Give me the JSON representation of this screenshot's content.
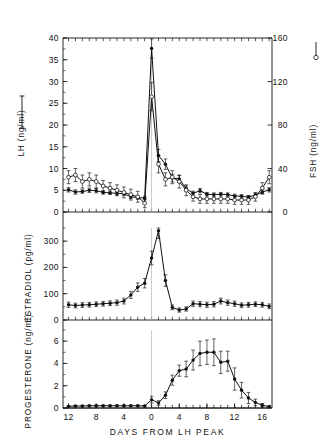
{
  "figure": {
    "xlabel": "DAYS FROM LH PEAK",
    "x_ticks": [
      "12",
      "8",
      "4",
      "0",
      "4",
      "8",
      "12",
      "16"
    ],
    "x_tick_values": [
      -12,
      -8,
      -4,
      0,
      4,
      8,
      12,
      16
    ],
    "x_range": [
      -12.8,
      17.4
    ],
    "reference_line_label": "0",
    "ink_color": "#111111"
  },
  "panels": {
    "top": {
      "left_axis_label": "LH (ng/ml)",
      "left_ticks": [
        "0",
        "5",
        "10",
        "15",
        "20",
        "25",
        "30",
        "35",
        "40"
      ],
      "right_axis_label": "FSH (ng/ml)",
      "right_ticks": [
        "0",
        "40",
        "80",
        "120",
        "160"
      ],
      "left_marker": "filled-circle",
      "right_marker": "open-circle"
    },
    "middle": {
      "left_axis_label": "ESTRADIOL (pg/ml)",
      "left_ticks": [
        "0",
        "100",
        "200",
        "300"
      ],
      "marker": "filled-circle"
    },
    "bottom": {
      "left_axis_label": "PROGESTERONE (ng/ml)",
      "left_ticks": [
        "0",
        "2",
        "4",
        "6"
      ],
      "marker": "filled-circle"
    }
  },
  "chart_data": {
    "type": "line",
    "title": "",
    "xlabel": "DAYS FROM LH PEAK",
    "subplots": [
      {
        "name": "LH and FSH",
        "ylabel": "LH (ng/ml)",
        "ylim": [
          0,
          40
        ],
        "y2label": "FSH (ng/ml)",
        "y2lim": [
          0,
          160
        ],
        "yticks": [
          0,
          5,
          10,
          15,
          20,
          25,
          30,
          35,
          40
        ],
        "y2ticks": [
          0,
          40,
          80,
          120,
          160
        ],
        "grid": false,
        "series": [
          {
            "name": "LH",
            "axis": "left",
            "marker": "filled-circle",
            "x": [
              -12,
              -11,
              -10,
              -9,
              -8,
              -7,
              -6,
              -5,
              -4,
              -3,
              -2,
              -1,
              0,
              1,
              2,
              3,
              4,
              5,
              6,
              7,
              8,
              9,
              10,
              11,
              12,
              13,
              14,
              15,
              16,
              17
            ],
            "values": [
              5.1,
              4.6,
              4.7,
              5.0,
              4.9,
              4.5,
              4.4,
              4.3,
              4.2,
              3.5,
              3.3,
              3.2,
              37.6,
              13.0,
              11.0,
              7.8,
              7.6,
              5.4,
              4.3,
              4.9,
              4.1,
              4.0,
              4.1,
              4.0,
              3.7,
              3.6,
              3.4,
              3.9,
              4.6,
              5.1
            ],
            "errors": [
              0.5,
              0.5,
              0.4,
              0.5,
              0.5,
              0.4,
              0.4,
              0.4,
              0.4,
              0.4,
              0.4,
              0.4,
              2.2,
              1.4,
              1.2,
              0.9,
              0.8,
              0.6,
              0.5,
              0.5,
              0.4,
              0.4,
              0.4,
              0.4,
              0.4,
              0.4,
              0.4,
              0.4,
              0.5,
              0.5
            ]
          },
          {
            "name": "FSH",
            "axis": "right",
            "marker": "open-circle",
            "x": [
              -12,
              -11,
              -10,
              -9,
              -8,
              -7,
              -6,
              -5,
              -4,
              -3,
              -2,
              -1,
              0,
              1,
              2,
              3,
              4,
              5,
              6,
              7,
              8,
              9,
              10,
              11,
              12,
              13,
              14,
              15,
              16,
              17
            ],
            "values": [
              32,
              34,
              28,
              30,
              28,
              24,
              22,
              20,
              18,
              16,
              14,
              8,
              106,
              44,
              30,
              32,
              28,
              20,
              14,
              12,
              12,
              12,
              12,
              12,
              11,
              11,
              11,
              14,
              22,
              32
            ],
            "errors": [
              6,
              6,
              6,
              6,
              6,
              5,
              5,
              5,
              5,
              5,
              5,
              4,
              13,
              8,
              6,
              6,
              6,
              5,
              4,
              4,
              4,
              4,
              4,
              4,
              4,
              4,
              4,
              4,
              5,
              6
            ]
          }
        ]
      },
      {
        "name": "Estradiol",
        "ylabel": "ESTRADIOL (pg/ml)",
        "ylim": [
          0,
          350
        ],
        "yticks": [
          0,
          100,
          200,
          300
        ],
        "grid": false,
        "series": [
          {
            "name": "Estradiol",
            "marker": "filled-circle",
            "x": [
              -12,
              -11,
              -10,
              -9,
              -8,
              -7,
              -6,
              -5,
              -4,
              -3,
              -2,
              -1,
              0,
              1,
              2,
              3,
              4,
              5,
              6,
              7,
              8,
              9,
              10,
              11,
              12,
              13,
              14,
              15,
              16,
              17
            ],
            "values": [
              58,
              55,
              57,
              58,
              60,
              62,
              64,
              66,
              72,
              95,
              125,
              140,
              236,
              340,
              150,
              48,
              38,
              42,
              62,
              60,
              58,
              60,
              72,
              66,
              62,
              56,
              58,
              60,
              58,
              52
            ],
            "errors": [
              10,
              9,
              9,
              9,
              9,
              9,
              9,
              10,
              11,
              13,
              16,
              18,
              26,
              30,
              22,
              9,
              8,
              8,
              10,
              10,
              10,
              10,
              11,
              10,
              10,
              9,
              9,
              9,
              9,
              9
            ]
          }
        ]
      },
      {
        "name": "Progesterone",
        "ylabel": "PROGESTERONE (ng/ml)",
        "ylim": [
          0,
          7
        ],
        "yticks": [
          0,
          2,
          4,
          6
        ],
        "grid": false,
        "series": [
          {
            "name": "Progesterone",
            "marker": "filled-circle",
            "x": [
              -12,
              -11,
              -10,
              -9,
              -8,
              -7,
              -6,
              -5,
              -4,
              -3,
              -2,
              -1,
              0,
              1,
              2,
              3,
              4,
              5,
              6,
              7,
              8,
              9,
              10,
              11,
              12,
              13,
              14,
              15,
              16,
              17
            ],
            "values": [
              0.15,
              0.18,
              0.18,
              0.2,
              0.2,
              0.2,
              0.2,
              0.2,
              0.2,
              0.2,
              0.2,
              0.18,
              0.75,
              0.45,
              1.15,
              2.5,
              3.35,
              3.5,
              4.3,
              4.9,
              5.0,
              5.0,
              4.1,
              4.2,
              2.6,
              1.6,
              0.9,
              0.5,
              0.25,
              0.12
            ],
            "errors": [
              0.05,
              0.05,
              0.05,
              0.05,
              0.05,
              0.05,
              0.05,
              0.05,
              0.05,
              0.05,
              0.05,
              0.05,
              0.3,
              0.2,
              0.3,
              0.45,
              0.5,
              0.7,
              0.9,
              1.1,
              1.1,
              1.2,
              1.0,
              0.9,
              1.0,
              0.7,
              0.5,
              0.3,
              0.15,
              0.08
            ]
          }
        ]
      }
    ]
  }
}
